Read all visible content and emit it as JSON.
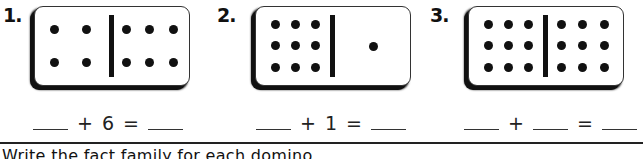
{
  "problems": [
    {
      "number": "1.",
      "domino": {
        "left_pips": 4,
        "right_pips": 6
      },
      "equation": {
        "blank1": "",
        "op": "+",
        "addend2": "6",
        "eq": "=",
        "blank2": ""
      }
    },
    {
      "number": "2.",
      "domino": {
        "left_pips": 9,
        "right_pips": 1
      },
      "equation": {
        "blank1": "",
        "op": "+",
        "addend2": "1",
        "eq": "=",
        "blank2": ""
      }
    },
    {
      "number": "3.",
      "domino": {
        "left_pips": 9,
        "right_pips": 9
      },
      "equation": {
        "blank1": "",
        "op": "+",
        "blank_mid": "",
        "eq": "=",
        "blank2": ""
      }
    }
  ],
  "instruction": "Write the fact family for each domino."
}
